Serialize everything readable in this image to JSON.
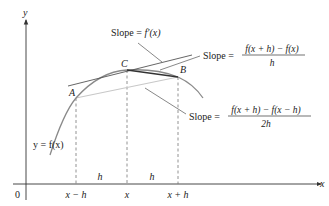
{
  "axes": {
    "y_label": "y",
    "x_label": "x",
    "origin_label": "0"
  },
  "points": {
    "A": "A",
    "B": "B",
    "C": "C"
  },
  "curve_label": "y = f(x)",
  "tick_labels": {
    "left": "x − h",
    "center": "x",
    "right": "x + h"
  },
  "interval_labels": {
    "left_h": "h",
    "right_h": "h"
  },
  "annotations": {
    "tangent": {
      "prefix": "Slope = ",
      "expr": "f′(x)"
    },
    "forward_difference": {
      "prefix": "Slope = ",
      "numerator": "f(x + h) − f(x)",
      "denominator": "h"
    },
    "central_difference": {
      "prefix": "Slope = ",
      "numerator": "f(x + h) − f(x − h)",
      "denominator": "2h"
    }
  },
  "colors": {
    "axis": "#333333",
    "curve": "#8a8a8a",
    "tangent": "#555555",
    "secant_forward": "#333333",
    "secant_central": "#c8c8c8",
    "dashed": "#777777",
    "text": "#222222"
  }
}
